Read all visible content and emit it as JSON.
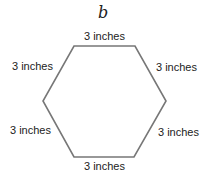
{
  "figure": {
    "label": "b",
    "shape": "regular hexagon",
    "stroke_color": "#777777",
    "sides": [
      {
        "position": "top",
        "label": "3 inches"
      },
      {
        "position": "upper-left",
        "label": "3 inches"
      },
      {
        "position": "upper-right",
        "label": "3 inches"
      },
      {
        "position": "lower-left",
        "label": "3 inches"
      },
      {
        "position": "lower-right",
        "label": "3 inches"
      },
      {
        "position": "bottom",
        "label": "3 inches"
      }
    ]
  }
}
